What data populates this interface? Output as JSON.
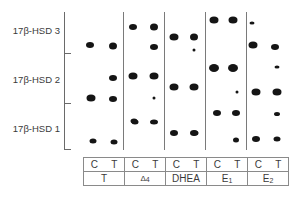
{
  "rows": [
    {
      "label": "17β-HSD 3"
    },
    {
      "label": "17β-HSD 2"
    },
    {
      "label": "17β-HSD 1"
    }
  ],
  "lanes": [
    {
      "substrate": "T",
      "control_label": "C",
      "transfected_label": "T"
    },
    {
      "substrate": "Δ4",
      "control_label": "C",
      "transfected_label": "T"
    },
    {
      "substrate": "DHEA",
      "control_label": "C",
      "transfected_label": "T"
    },
    {
      "substrate": "E1",
      "control_label": "C",
      "transfected_label": "T"
    },
    {
      "substrate": "E2",
      "control_label": "C",
      "transfected_label": "T"
    }
  ],
  "colors": {
    "dot": "#151515",
    "axis": "#6a6a6a",
    "border": "#8a8a8a"
  },
  "dots": [
    {
      "x": 90,
      "y": 45,
      "w": 8,
      "h": 6
    },
    {
      "x": 113,
      "y": 46,
      "w": 8,
      "h": 7
    },
    {
      "x": 133,
      "y": 27,
      "w": 8,
      "h": 6
    },
    {
      "x": 154,
      "y": 27,
      "w": 8,
      "h": 7
    },
    {
      "x": 154,
      "y": 47,
      "w": 8,
      "h": 6
    },
    {
      "x": 174,
      "y": 37,
      "w": 9,
      "h": 7
    },
    {
      "x": 194,
      "y": 37,
      "w": 8,
      "h": 7
    },
    {
      "x": 194,
      "y": 50,
      "w": 3,
      "h": 3
    },
    {
      "x": 214,
      "y": 20,
      "w": 9,
      "h": 7
    },
    {
      "x": 233,
      "y": 20,
      "w": 9,
      "h": 7
    },
    {
      "x": 252,
      "y": 23,
      "w": 5,
      "h": 3
    },
    {
      "x": 253,
      "y": 45,
      "w": 9,
      "h": 7
    },
    {
      "x": 275,
      "y": 47,
      "w": 8,
      "h": 6
    },
    {
      "x": 113,
      "y": 78,
      "w": 8,
      "h": 6
    },
    {
      "x": 133,
      "y": 76,
      "w": 9,
      "h": 7
    },
    {
      "x": 154,
      "y": 76,
      "w": 9,
      "h": 7
    },
    {
      "x": 154,
      "y": 98,
      "w": 3,
      "h": 3
    },
    {
      "x": 174,
      "y": 87,
      "w": 9,
      "h": 7
    },
    {
      "x": 194,
      "y": 87,
      "w": 9,
      "h": 7
    },
    {
      "x": 214,
      "y": 68,
      "w": 10,
      "h": 8
    },
    {
      "x": 233,
      "y": 68,
      "w": 10,
      "h": 8
    },
    {
      "x": 237,
      "y": 92,
      "w": 3,
      "h": 3
    },
    {
      "x": 256,
      "y": 92,
      "w": 9,
      "h": 7
    },
    {
      "x": 277,
      "y": 92,
      "w": 9,
      "h": 7
    },
    {
      "x": 277,
      "y": 67,
      "w": 5,
      "h": 3
    },
    {
      "x": 91,
      "y": 98,
      "w": 9,
      "h": 7
    },
    {
      "x": 113,
      "y": 99,
      "w": 8,
      "h": 6
    },
    {
      "x": 135,
      "y": 122,
      "w": 7,
      "h": 5
    },
    {
      "x": 134,
      "y": 121,
      "w": 7,
      "h": 5
    },
    {
      "x": 154,
      "y": 122,
      "w": 8,
      "h": 5
    },
    {
      "x": 174,
      "y": 133,
      "w": 8,
      "h": 6
    },
    {
      "x": 194,
      "y": 133,
      "w": 8,
      "h": 6
    },
    {
      "x": 217,
      "y": 113,
      "w": 8,
      "h": 6
    },
    {
      "x": 236,
      "y": 113,
      "w": 8,
      "h": 6
    },
    {
      "x": 236,
      "y": 140,
      "w": 6,
      "h": 5
    },
    {
      "x": 256,
      "y": 139,
      "w": 8,
      "h": 6
    },
    {
      "x": 277,
      "y": 139,
      "w": 7,
      "h": 5
    },
    {
      "x": 277,
      "y": 114,
      "w": 6,
      "h": 4
    },
    {
      "x": 93,
      "y": 141,
      "w": 7,
      "h": 5
    },
    {
      "x": 114,
      "y": 142,
      "w": 7,
      "h": 5
    },
    {
      "x": 195,
      "y": 133,
      "w": 7,
      "h": 5
    }
  ]
}
